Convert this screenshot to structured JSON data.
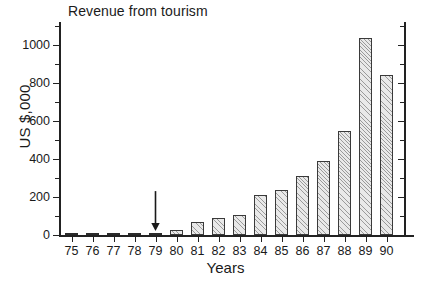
{
  "chart_data": {
    "type": "bar",
    "title": "Revenue from tourism",
    "xlabel": "Years",
    "ylabel": "US $,000",
    "categories": [
      "75",
      "76",
      "77",
      "78",
      "79",
      "80",
      "81",
      "82",
      "83",
      "84",
      "85",
      "86",
      "87",
      "88",
      "89",
      "90"
    ],
    "values": [
      2,
      2,
      3,
      6,
      10,
      27,
      68,
      88,
      105,
      208,
      235,
      312,
      392,
      548,
      1035,
      840
    ],
    "ylim": [
      0,
      1100
    ],
    "ytick_labels": [
      "0",
      "200",
      "400",
      "600",
      "800",
      "1000"
    ],
    "ytick_values": [
      0,
      200,
      400,
      600,
      800,
      1000
    ],
    "yminor_values": [
      100,
      300,
      500,
      700,
      900,
      1100
    ],
    "grid": false,
    "legend": false,
    "series_name": "Revenue",
    "annotations": [
      {
        "name": "down-arrow",
        "target_category": "79",
        "target_value": 10,
        "text": ""
      }
    ],
    "colors": {
      "bar_fill": "#e9e9e9",
      "bar_edge": "#3a3a3a",
      "axis": "#222222",
      "text": "#1a1a1a",
      "background": "#ffffff"
    }
  }
}
